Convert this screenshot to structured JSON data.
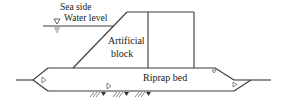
{
  "diagram": {
    "type": "breakwater cross-section",
    "labels": {
      "sea_side": "Sea side",
      "water_level": "Water level",
      "artificial": "Artificial",
      "block": "block",
      "riprap_bed": "Riprap bed"
    },
    "symbols": {
      "water_level_marker": "inverted-triangle-icon",
      "stone_markers": "small-triangle-icon",
      "seabed_hatch": "ground-hatch-icon"
    },
    "colors": {
      "line": "#3a3a3a",
      "text": "#222222",
      "background": "#ffffff"
    }
  }
}
